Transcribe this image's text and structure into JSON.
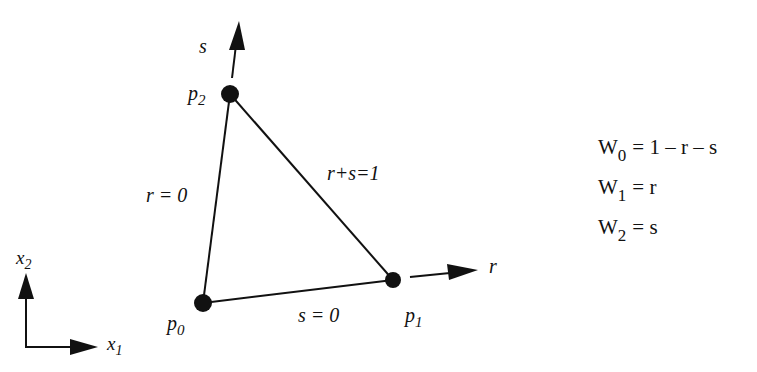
{
  "diagram": {
    "type": "triangle-parametric-coordinates",
    "points": [
      {
        "id": "p0",
        "label": "p",
        "sub": "0",
        "x": 203,
        "y": 303
      },
      {
        "id": "p1",
        "label": "p",
        "sub": "1",
        "x": 393,
        "y": 280
      },
      {
        "id": "p2",
        "label": "p",
        "sub": "2",
        "x": 230,
        "y": 94
      }
    ],
    "edge_labels": {
      "r0": "r = 0",
      "s0": "s = 0",
      "rs1": "r+s=1"
    },
    "axes": {
      "s_label": "s",
      "r_label": "r",
      "x1_label": "x",
      "x1_sub": "1",
      "x2_label": "x",
      "x2_sub": "2"
    },
    "weights": [
      {
        "name": "W",
        "sub": "0",
        "expr": "= 1 – r – s"
      },
      {
        "name": "W",
        "sub": "1",
        "expr": "= r"
      },
      {
        "name": "W",
        "sub": "2",
        "expr": "= s"
      }
    ],
    "colors": {
      "ink": "#111111",
      "background": "#ffffff"
    }
  }
}
